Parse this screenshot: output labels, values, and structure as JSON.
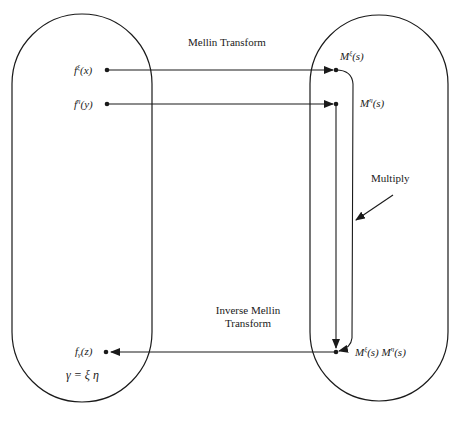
{
  "diagram": {
    "title_top_arrow": "Mellin Transform",
    "title_bottom_arrow_line1": "Inverse Mellin",
    "title_bottom_arrow_line2": "Transform",
    "multiply_label": "Multiply",
    "left_domain": {
      "f_xi": {
        "base": "f",
        "sup": "ξ",
        "arg": "(x)"
      },
      "f_eta": {
        "base": "f",
        "sup": "η",
        "arg": "(y)"
      },
      "f_gamma": {
        "base": "f",
        "sub": "γ",
        "arg": "(z)"
      },
      "relation": "γ = ξ η"
    },
    "right_domain": {
      "M_xi": {
        "base": "M",
        "sup": "ξ",
        "arg": "(s)"
      },
      "M_eta": {
        "base": "M",
        "sup": "η",
        "arg": "(s)"
      },
      "product": {
        "a_base": "M",
        "a_sup": "ξ",
        "a_arg": "(s)",
        "b_base": "M",
        "b_sup": "η",
        "b_arg": "(s)"
      }
    },
    "colors": {
      "line": "#1a1a1a",
      "background": "#ffffff"
    }
  }
}
